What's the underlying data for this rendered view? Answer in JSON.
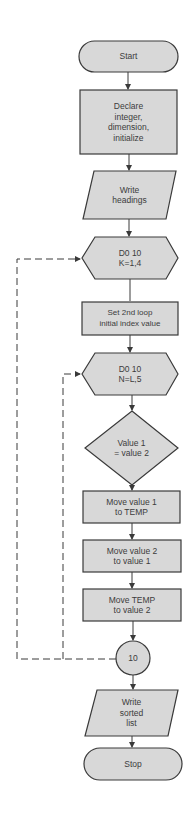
{
  "diagram": {
    "type": "flowchart",
    "colors": {
      "fill": "#d8d8d8",
      "stroke": "#3a3a3a",
      "text": "#3c3c3c"
    },
    "nodes": {
      "start": {
        "shape": "terminator",
        "label": "Start"
      },
      "declare": {
        "shape": "process",
        "label": "Declare\ninteger,\ndimension,\ninitialize"
      },
      "write_headings": {
        "shape": "input-output",
        "label": "Write\nheadings"
      },
      "do_k": {
        "shape": "preparation",
        "label": "D0 10\nK=1,4"
      },
      "set_loop": {
        "shape": "process",
        "label": "Set 2nd loop\ninitial index value"
      },
      "do_n": {
        "shape": "preparation",
        "label": "D0 10\nN=L,5"
      },
      "compare": {
        "shape": "decision",
        "label": "Value 1\n= value 2"
      },
      "move1": {
        "shape": "process",
        "label": "Move value 1\nto TEMP"
      },
      "move2": {
        "shape": "process",
        "label": "Move value 2\nto value 1"
      },
      "move3": {
        "shape": "process",
        "label": "Move TEMP\nto value 2"
      },
      "connector": {
        "shape": "connector",
        "label": "10"
      },
      "write_sorted": {
        "shape": "input-output",
        "label": "Write\nsorted\nlist"
      },
      "stop": {
        "shape": "terminator",
        "label": "Stop"
      }
    },
    "loops": [
      {
        "from": "connector",
        "to": "do_k",
        "style": "dashed",
        "name": "outer-loop"
      },
      {
        "from": "connector",
        "to": "do_n",
        "style": "dashed",
        "name": "inner-loop"
      }
    ]
  }
}
